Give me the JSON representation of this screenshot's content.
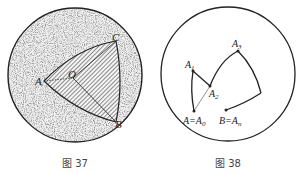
{
  "figures": [
    {
      "id": "fig37",
      "caption": "图 37",
      "labels": {
        "A": "A",
        "O": "O",
        "B": "B",
        "C": "C"
      }
    },
    {
      "id": "fig38",
      "caption": "图 38",
      "labels": {
        "A1": "A",
        "A1_sub": "1",
        "A2": "A",
        "A2_sub": "2",
        "A3": "A",
        "A3_sub": "3",
        "A0": "A=A",
        "A0_sub": "0",
        "An": "B=A",
        "An_sub": "n"
      }
    }
  ],
  "colors": {
    "stroke": "#222222",
    "speckle_fill": "#d8d8d8",
    "hatch_fill": "#8a8a8a",
    "caption": "#444444"
  }
}
